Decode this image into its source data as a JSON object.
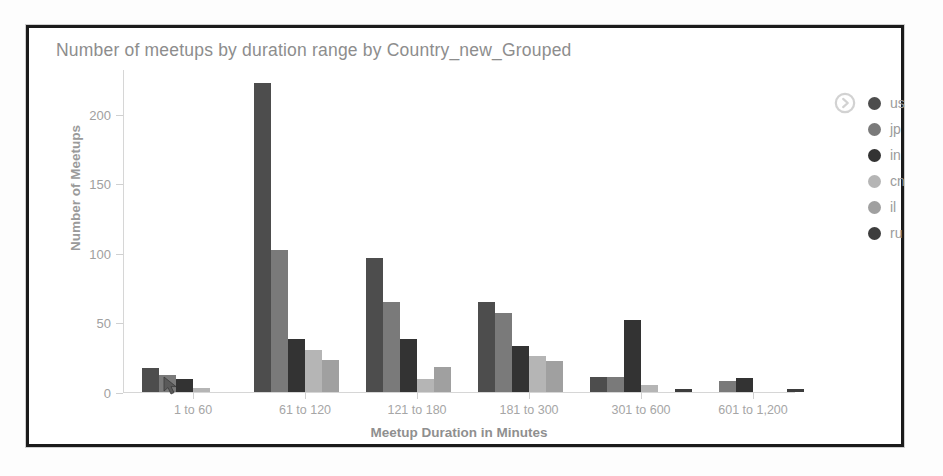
{
  "chart_data": {
    "type": "bar",
    "title": "Number of meetups by duration range by Country_new_Grouped",
    "xlabel": "Meetup Duration in Minutes",
    "ylabel": "Number of Meetups",
    "ylim": [
      0,
      232
    ],
    "yticks": [
      0,
      50,
      100,
      150,
      200
    ],
    "ytick_labels": [
      "0",
      "50",
      "100",
      "150",
      "200"
    ],
    "grid": false,
    "legend_position": "right",
    "categories": [
      "1 to 60",
      "61 to 120",
      "121 to 180",
      "181 to 300",
      "301 to 600",
      "601 to 1,200"
    ],
    "series": [
      {
        "name": "us",
        "color": "#4d4d4d",
        "values": [
          17,
          222,
          96,
          65,
          11,
          0
        ]
      },
      {
        "name": "jp",
        "color": "#7a7a7a",
        "values": [
          12,
          102,
          65,
          57,
          11,
          8
        ]
      },
      {
        "name": "in",
        "color": "#333333",
        "values": [
          9,
          38,
          38,
          33,
          52,
          10
        ]
      },
      {
        "name": "cn",
        "color": "#b5b5b5",
        "values": [
          3,
          30,
          9,
          26,
          5,
          0
        ]
      },
      {
        "name": "il",
        "color": "#a0a0a0",
        "values": [
          0,
          23,
          18,
          22,
          0,
          0
        ]
      },
      {
        "name": "ru",
        "color": "#3d3d3d",
        "values": [
          0,
          0,
          0,
          0,
          2,
          2
        ]
      }
    ]
  },
  "legend": {
    "expand_icon": "chevron-right-circle-icon",
    "entries": [
      "us",
      "jp",
      "in",
      "cn",
      "il",
      "ru"
    ]
  },
  "colors": {
    "frame": "#1b1b1b",
    "axis": "#d6d6d6",
    "title_text": "#8d8d8d",
    "tick_text": "#a0a0a0",
    "axis_title_text": "#8f8f8f"
  }
}
